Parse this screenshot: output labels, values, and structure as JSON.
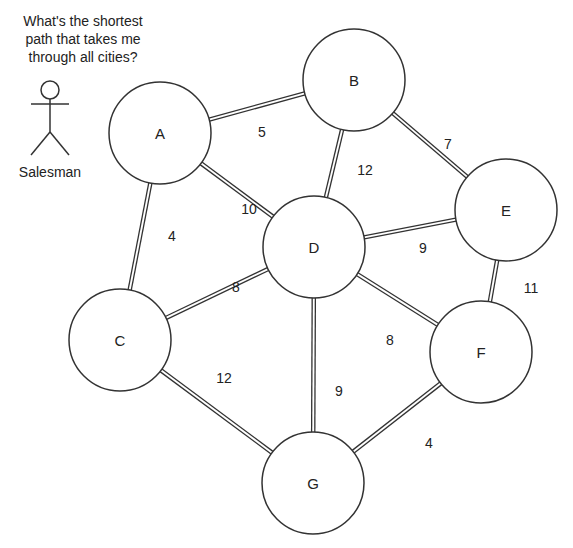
{
  "question": "What's the shortest path that takes me through all cities?",
  "actor": {
    "label": "Salesman",
    "icon": "stick-figure-icon"
  },
  "colors": {
    "stroke": "#333333",
    "background": "#ffffff",
    "text": "#222222"
  },
  "nodes": [
    {
      "id": "A",
      "label": "A",
      "x": 160,
      "y": 133,
      "r": 51
    },
    {
      "id": "B",
      "label": "B",
      "x": 354,
      "y": 80,
      "r": 51
    },
    {
      "id": "C",
      "label": "C",
      "x": 120,
      "y": 340,
      "r": 51
    },
    {
      "id": "D",
      "label": "D",
      "x": 314,
      "y": 247,
      "r": 51
    },
    {
      "id": "E",
      "label": "E",
      "x": 506,
      "y": 210,
      "r": 51
    },
    {
      "id": "F",
      "label": "F",
      "x": 481,
      "y": 352,
      "r": 51
    },
    {
      "id": "G",
      "label": "G",
      "x": 313,
      "y": 483,
      "r": 51
    }
  ],
  "edges": [
    {
      "from": "A",
      "to": "B",
      "weight": "5",
      "lx": 262,
      "ly": 132
    },
    {
      "from": "A",
      "to": "D",
      "weight": "10",
      "lx": 249,
      "ly": 209
    },
    {
      "from": "A",
      "to": "C",
      "weight": "4",
      "lx": 172,
      "ly": 236
    },
    {
      "from": "B",
      "to": "D",
      "weight": "12",
      "lx": 365,
      "ly": 170
    },
    {
      "from": "B",
      "to": "E",
      "weight": "7",
      "lx": 448,
      "ly": 144
    },
    {
      "from": "D",
      "to": "E",
      "weight": "9",
      "lx": 423,
      "ly": 248
    },
    {
      "from": "E",
      "to": "F",
      "weight": "11",
      "lx": 531,
      "ly": 288
    },
    {
      "from": "D",
      "to": "C",
      "weight": "8",
      "lx": 236,
      "ly": 287
    },
    {
      "from": "D",
      "to": "F",
      "weight": "8",
      "lx": 390,
      "ly": 340
    },
    {
      "from": "D",
      "to": "G",
      "weight": "9",
      "lx": 339,
      "ly": 391
    },
    {
      "from": "C",
      "to": "G",
      "weight": "12",
      "lx": 224,
      "ly": 378
    },
    {
      "from": "F",
      "to": "G",
      "weight": "4",
      "lx": 429,
      "ly": 443
    }
  ]
}
